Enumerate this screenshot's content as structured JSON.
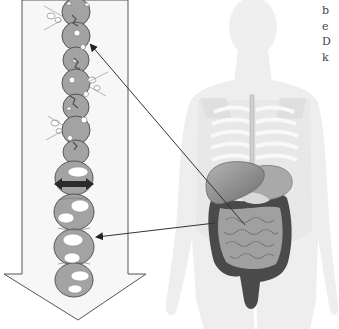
{
  "figure": {
    "big_arrow": {
      "direction": "down",
      "fill": "#f7f7f7",
      "stroke": "#555555"
    },
    "intestine_tube": {
      "fill": "#9a9a9a",
      "outline": "#555555",
      "contraction_arrow": {
        "type": "double-headed",
        "color": "#2b2b2b"
      }
    },
    "body_silhouette": {
      "fill": "#eeeeee"
    },
    "organs": {
      "liver": "#8a8a8a",
      "stomach": "#a8a8a8",
      "colon": "#4a4a4a",
      "small_intestine": "#9c9c9c"
    },
    "pointers": [
      {
        "name": "pointer-upper",
        "from": [
          245,
          225
        ],
        "to": [
          89,
          43
        ]
      },
      {
        "name": "pointer-lower",
        "from": [
          215,
          223
        ],
        "to": [
          95,
          237
        ]
      }
    ]
  },
  "side_text": {
    "lines": [
      "b",
      "e",
      "D",
      "k"
    ]
  }
}
